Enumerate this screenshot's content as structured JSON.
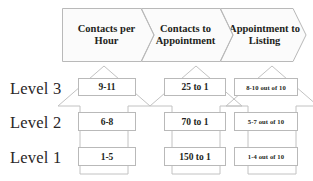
{
  "header": {
    "stages": [
      {
        "label": "Contacts per Hour",
        "name": "stage-contacts-per-hour"
      },
      {
        "label": "Contacts to Appointment",
        "name": "stage-contacts-to-appointment"
      },
      {
        "label": "Appointment to Listing",
        "name": "stage-appointment-to-listing"
      }
    ]
  },
  "levels": [
    {
      "label": "Level 3"
    },
    {
      "label": "Level 2"
    },
    {
      "label": "Level 1"
    }
  ],
  "matrix": {
    "level3": {
      "contacts_per_hour": "9-11",
      "contacts_to_appointment": "25 to 1",
      "appointment_to_listing": "8-10 out of 10"
    },
    "level2": {
      "contacts_per_hour": "6-8",
      "contacts_to_appointment": "70 to 1",
      "appointment_to_listing": "5-7 out of 10"
    },
    "level1": {
      "contacts_per_hour": "1-5",
      "contacts_to_appointment": "150 to 1",
      "appointment_to_listing": "1-4 out of 10"
    }
  },
  "colors": {
    "outline": "#b9b9b9",
    "banner_fill": "#fbfbfb",
    "text": "#231f20",
    "level_text": "#2a2627"
  }
}
